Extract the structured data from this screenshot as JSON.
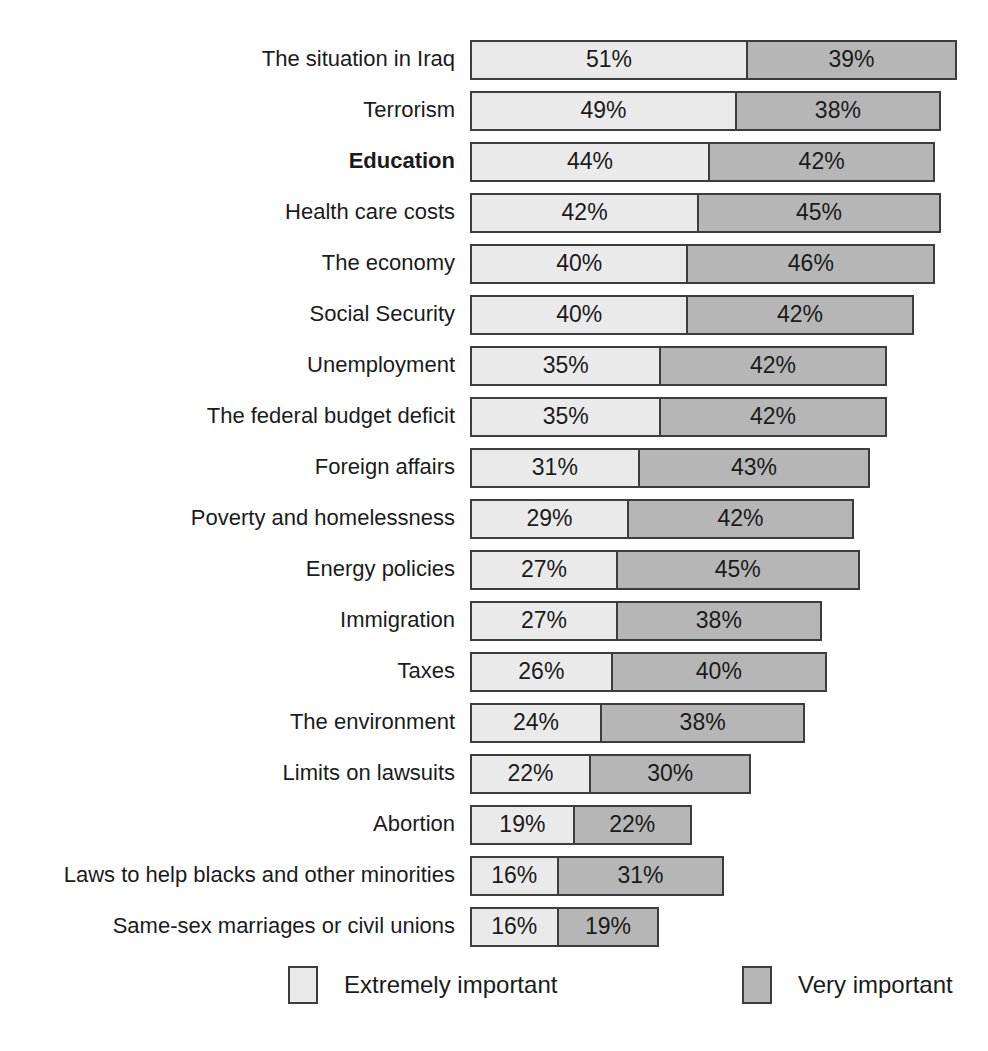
{
  "chart_data": {
    "type": "bar",
    "orientation": "horizontal",
    "stacked": true,
    "title": "",
    "xlabel": "",
    "ylabel": "",
    "value_suffix": "%",
    "series_names": [
      "Extremely important",
      "Very important"
    ],
    "categories": [
      "The situation in Iraq",
      "Terrorism",
      "Education",
      "Health care costs",
      "The economy",
      "Social Security",
      "Unemployment",
      "The federal budget deficit",
      "Foreign affairs",
      "Poverty and homelessness",
      "Energy policies",
      "Immigration",
      "Taxes",
      "The environment",
      "Limits on lawsuits",
      "Abortion",
      "Laws to help blacks and other minorities",
      "Same-sex marriages or civil unions"
    ],
    "rows": [
      {
        "label": "The situation in Iraq",
        "extremely": 51,
        "very": 39,
        "bold": false
      },
      {
        "label": "Terrorism",
        "extremely": 49,
        "very": 38,
        "bold": false
      },
      {
        "label": "Education",
        "extremely": 44,
        "very": 42,
        "bold": true
      },
      {
        "label": "Health care costs",
        "extremely": 42,
        "very": 45,
        "bold": false
      },
      {
        "label": "The economy",
        "extremely": 40,
        "very": 46,
        "bold": false
      },
      {
        "label": "Social Security",
        "extremely": 40,
        "very": 42,
        "bold": false
      },
      {
        "label": "Unemployment",
        "extremely": 35,
        "very": 42,
        "bold": false
      },
      {
        "label": "The federal budget deficit",
        "extremely": 35,
        "very": 42,
        "bold": false
      },
      {
        "label": "Foreign affairs",
        "extremely": 31,
        "very": 43,
        "bold": false
      },
      {
        "label": "Poverty and homelessness",
        "extremely": 29,
        "very": 42,
        "bold": false
      },
      {
        "label": "Energy policies",
        "extremely": 27,
        "very": 45,
        "bold": false
      },
      {
        "label": "Immigration",
        "extremely": 27,
        "very": 38,
        "bold": false
      },
      {
        "label": "Taxes",
        "extremely": 26,
        "very": 40,
        "bold": false
      },
      {
        "label": "The environment",
        "extremely": 24,
        "very": 38,
        "bold": false
      },
      {
        "label": "Limits on lawsuits",
        "extremely": 22,
        "very": 30,
        "bold": false
      },
      {
        "label": "Abortion",
        "extremely": 19,
        "very": 22,
        "bold": false
      },
      {
        "label": "Laws to help blacks and other minorities",
        "extremely": 16,
        "very": 31,
        "bold": false
      },
      {
        "label": "Same-sex marriages or civil unions",
        "extremely": 16,
        "very": 19,
        "bold": false
      }
    ],
    "legend": {
      "position": "bottom",
      "items": [
        {
          "label": "Extremely important",
          "color": "#eaeaea"
        },
        {
          "label": "Very important",
          "color": "#b5b6b5"
        }
      ]
    },
    "colors": {
      "extremely_fill": "#eaeaea",
      "very_fill": "#b5b6b5",
      "border": "#3d3d3d",
      "text": "#1b1b1b",
      "background": "#ffffff"
    },
    "axis": {
      "grid": false,
      "value_range_percent": [
        0,
        100
      ]
    }
  }
}
